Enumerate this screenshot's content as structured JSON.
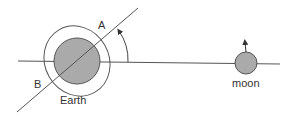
{
  "diagram": {
    "labels": {
      "point_a": "A",
      "point_b": "B",
      "earth": "Earth",
      "moon": "moon"
    },
    "colors": {
      "line": "#555555",
      "body_fill": "#aaaaaa",
      "body_stroke": "#555555",
      "background": "#ffffff"
    }
  }
}
